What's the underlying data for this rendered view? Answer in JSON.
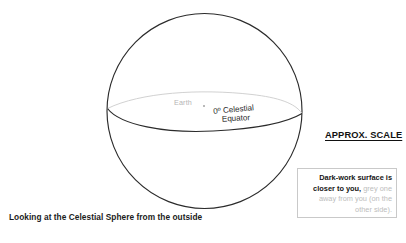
{
  "diagram": {
    "title_caption": "Looking at the Celestial Sphere from the outside",
    "sphere": {
      "earth_label": "Earth",
      "equator_label_line1": "0º Celestial",
      "equator_label_line2": "Equator",
      "outline_color": "#2b2b2b",
      "front_equator_color": "#2b2b2b",
      "back_equator_color": "#cfcfcf"
    },
    "scale_note": {
      "heading": "APPROX. SCALE",
      "body_bold": "Dark-work surface is closer to you,",
      "body_grey": " grey one away from you (on the other side).",
      "border_color": "#c9c9c9",
      "bold_color": "#151515",
      "grey_color": "#bdbdbd"
    }
  }
}
